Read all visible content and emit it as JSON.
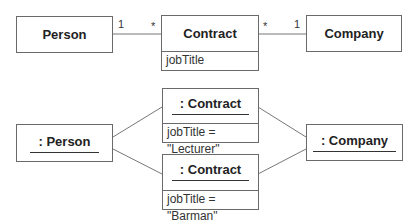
{
  "class_diagram": {
    "person": {
      "name": "Person"
    },
    "contract": {
      "name": "Contract",
      "attribute": "jobTitle"
    },
    "company": {
      "name": "Company"
    },
    "associations": [
      {
        "from": "Person",
        "to": "Contract",
        "from_multiplicity": "1",
        "to_multiplicity": "*"
      },
      {
        "from": "Contract",
        "to": "Company",
        "from_multiplicity": "*",
        "to_multiplicity": "1"
      }
    ]
  },
  "object_diagram": {
    "person": {
      "name": ": Person"
    },
    "contract_1": {
      "name": ": Contract",
      "attribute": "jobTitle = \"Lecturer\""
    },
    "contract_2": {
      "name": ": Contract",
      "attribute": "jobTitle = \"Barman\""
    },
    "company": {
      "name": ": Company"
    }
  },
  "colors": {
    "border": "#6a6a6a",
    "text": "#222222",
    "background": "#ffffff"
  }
}
